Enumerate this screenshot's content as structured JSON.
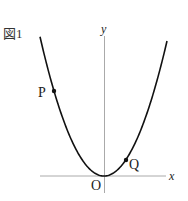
{
  "figure": {
    "label": "図1",
    "axes": {
      "x_label": "x",
      "y_label": "y",
      "origin_label": "O"
    },
    "curve": {
      "type": "parabola",
      "equation_form": "y = ax^2 (a>0)"
    },
    "points": [
      {
        "name": "P",
        "side": "left"
      },
      {
        "name": "Q",
        "side": "right"
      }
    ]
  }
}
